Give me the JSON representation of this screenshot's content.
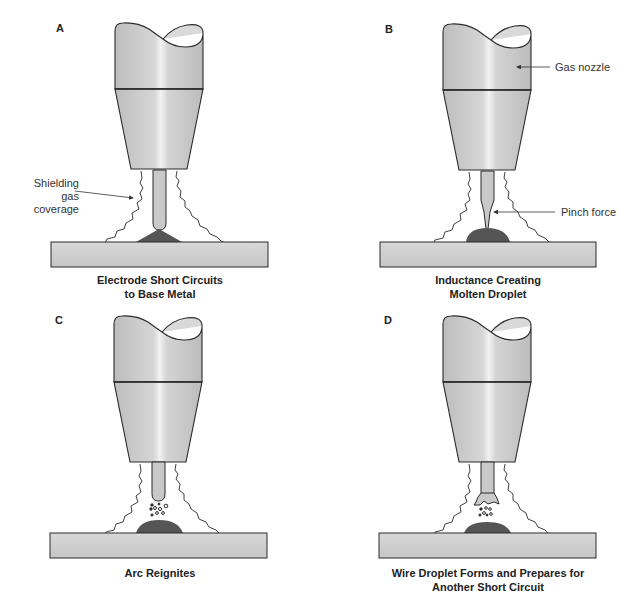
{
  "panels": [
    {
      "id": "A",
      "letter": "A",
      "caption_line1": "Electrode Short Circuits",
      "caption_line2": "to Base Metal",
      "state": "short-circuit",
      "callouts": [
        {
          "line1": "Shielding",
          "line2": "gas coverage"
        }
      ]
    },
    {
      "id": "B",
      "letter": "B",
      "caption_line1": "Inductance Creating",
      "caption_line2": "Molten Droplet",
      "state": "pinch",
      "callouts": [
        {
          "label": "Gas nozzle"
        },
        {
          "label": "Pinch force"
        }
      ]
    },
    {
      "id": "C",
      "letter": "C",
      "caption_line1": "Arc Reignites",
      "caption_line2": "",
      "state": "arc-reignite"
    },
    {
      "id": "D",
      "letter": "D",
      "caption_line1": "Wire Droplet Forms and Prepares for",
      "caption_line2": "Another Short Circuit",
      "state": "droplet-forming"
    }
  ],
  "colors": {
    "nozzle_fill": "#c8c8c8",
    "nozzle_highlight": "#ececec",
    "plate_fill": "#cfcfcf",
    "weld_pool": "#555555",
    "outline": "#2a2a2a",
    "text": "#222222"
  }
}
